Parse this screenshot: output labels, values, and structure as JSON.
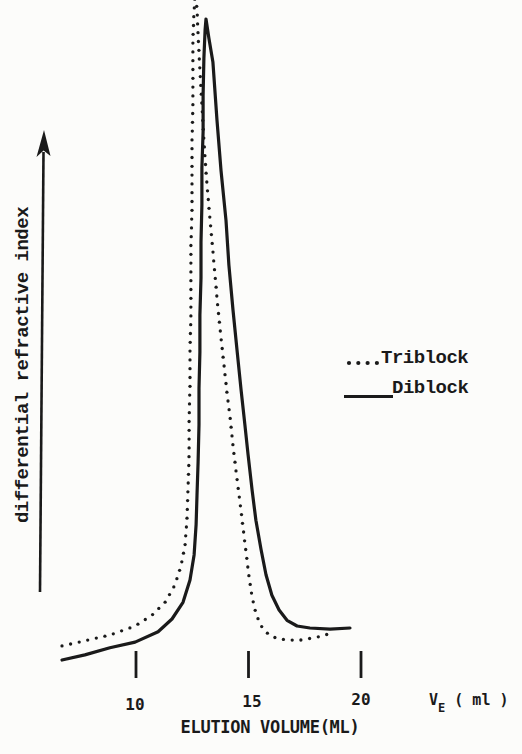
{
  "figure": {
    "background": "#fcfcfa",
    "ink_color": "#1a1a1a"
  },
  "y_axis": {
    "label": "differential refractive index",
    "arrow": "up"
  },
  "x_axis": {
    "label": "ELUTION VOLUME(ML)",
    "unit": {
      "symbol": "V",
      "subscript": "E",
      "suffix": " ( ml )"
    },
    "ticks": [
      {
        "label": "10",
        "ml": 10
      },
      {
        "label": "15",
        "ml": 15
      },
      {
        "label": "20",
        "ml": 20
      }
    ]
  },
  "legend": {
    "position": "middle-right",
    "items": [
      {
        "label": "Triblock",
        "marker": "dotted"
      },
      {
        "label": "Diblock",
        "marker": "solid"
      }
    ]
  },
  "chart_data": {
    "type": "line",
    "title": "",
    "xlabel": "ELUTION VOLUME(ML)",
    "ylabel": "differential refractive index",
    "x_unit": "ml",
    "xlim": [
      6.5,
      20.5
    ],
    "x_ticks": [
      10,
      15,
      20
    ],
    "grid": false,
    "y_axis_note": "unlabeled arbitrary units; intensity relative to Diblock peak = 1.0; Triblock peak is clipped at top of figure",
    "series": [
      {
        "name": "Diblock",
        "line_style": "solid",
        "peak_ml": 13.1,
        "points": [
          [
            6.71,
            0.0
          ],
          [
            7.73,
            0.008
          ],
          [
            8.84,
            0.019
          ],
          [
            9.96,
            0.028
          ],
          [
            10.98,
            0.044
          ],
          [
            11.6,
            0.064
          ],
          [
            12.09,
            0.09
          ],
          [
            12.4,
            0.125
          ],
          [
            12.58,
            0.164
          ],
          [
            12.67,
            0.211
          ],
          [
            12.71,
            0.257
          ],
          [
            12.76,
            0.309
          ],
          [
            12.8,
            0.367
          ],
          [
            12.8,
            0.424
          ],
          [
            12.84,
            0.48
          ],
          [
            12.84,
            0.538
          ],
          [
            12.89,
            0.596
          ],
          [
            12.89,
            0.652
          ],
          [
            12.93,
            0.71
          ],
          [
            12.93,
            0.768
          ],
          [
            12.98,
            0.824
          ],
          [
            12.98,
            0.881
          ],
          [
            13.02,
            0.939
          ],
          [
            13.07,
            0.983
          ],
          [
            13.11,
            1.0
          ],
          [
            13.24,
            0.97
          ],
          [
            13.42,
            0.933
          ],
          [
            13.6,
            0.842
          ],
          [
            13.78,
            0.764
          ],
          [
            14.0,
            0.686
          ],
          [
            14.13,
            0.616
          ],
          [
            14.31,
            0.546
          ],
          [
            14.49,
            0.484
          ],
          [
            14.67,
            0.421
          ],
          [
            14.84,
            0.367
          ],
          [
            14.98,
            0.32
          ],
          [
            15.16,
            0.265
          ],
          [
            15.33,
            0.218
          ],
          [
            15.56,
            0.172
          ],
          [
            15.78,
            0.133
          ],
          [
            16.04,
            0.101
          ],
          [
            16.36,
            0.078
          ],
          [
            16.71,
            0.062
          ],
          [
            17.16,
            0.053
          ],
          [
            17.73,
            0.05
          ],
          [
            18.62,
            0.048
          ],
          [
            19.51,
            0.05
          ]
        ]
      },
      {
        "name": "Triblock",
        "line_style": "dotted",
        "peak_ml": 12.6,
        "points": [
          [
            6.71,
            0.022
          ],
          [
            7.73,
            0.03
          ],
          [
            8.84,
            0.039
          ],
          [
            9.96,
            0.053
          ],
          [
            10.71,
            0.07
          ],
          [
            11.29,
            0.09
          ],
          [
            11.73,
            0.117
          ],
          [
            12.0,
            0.147
          ],
          [
            12.18,
            0.179
          ],
          [
            12.27,
            0.222
          ],
          [
            12.31,
            0.265
          ],
          [
            12.36,
            0.32
          ],
          [
            12.36,
            0.374
          ],
          [
            12.4,
            0.429
          ],
          [
            12.4,
            0.484
          ],
          [
            12.44,
            0.538
          ],
          [
            12.44,
            0.593
          ],
          [
            12.44,
            0.647
          ],
          [
            12.49,
            0.702
          ],
          [
            12.49,
            0.757
          ],
          [
            12.49,
            0.811
          ],
          [
            12.53,
            0.866
          ],
          [
            12.53,
            0.92
          ],
          [
            12.53,
            0.97
          ],
          [
            12.58,
            1.011
          ],
          [
            12.62,
            1.039
          ],
          [
            12.71,
            1.017
          ],
          [
            12.76,
            0.975
          ],
          [
            12.84,
            0.92
          ],
          [
            12.93,
            0.866
          ],
          [
            13.02,
            0.811
          ],
          [
            13.11,
            0.761
          ],
          [
            13.24,
            0.707
          ],
          [
            13.38,
            0.652
          ],
          [
            13.51,
            0.601
          ],
          [
            13.64,
            0.549
          ],
          [
            13.78,
            0.502
          ],
          [
            13.91,
            0.46
          ],
          [
            14.04,
            0.418
          ],
          [
            14.18,
            0.379
          ],
          [
            14.31,
            0.335
          ],
          [
            14.44,
            0.296
          ],
          [
            14.62,
            0.246
          ],
          [
            14.76,
            0.206
          ],
          [
            14.89,
            0.168
          ],
          [
            15.02,
            0.131
          ],
          [
            15.16,
            0.098
          ],
          [
            15.33,
            0.073
          ],
          [
            15.51,
            0.056
          ],
          [
            15.73,
            0.045
          ],
          [
            16.0,
            0.037
          ],
          [
            16.36,
            0.033
          ],
          [
            16.8,
            0.031
          ],
          [
            17.29,
            0.031
          ],
          [
            17.78,
            0.034
          ],
          [
            18.22,
            0.037
          ],
          [
            18.67,
            0.042
          ]
        ]
      }
    ]
  },
  "render_calibration": {
    "x_at_10ml": 136,
    "px_per_ml": 22.5,
    "baseline_y": 660,
    "intensity_scale": 641,
    "tick_top": 651,
    "tick_bottom": 678,
    "dot_spacing": 8.8,
    "dot_radius": 1.65
  }
}
